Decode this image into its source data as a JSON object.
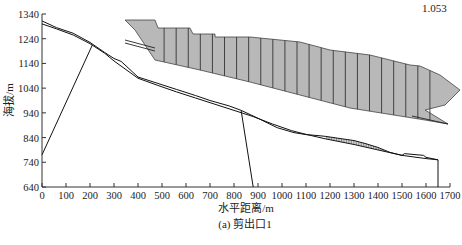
{
  "chart_data": {
    "type": "line",
    "title": "",
    "caption": "(a) 剪出口1",
    "xlabel": "水平距离/m",
    "ylabel": "海拔/m",
    "xlim": [
      0,
      1700
    ],
    "ylim": [
      640,
      1340
    ],
    "xticks": [
      0,
      100,
      200,
      300,
      400,
      500,
      600,
      700,
      800,
      900,
      1000,
      1100,
      1200,
      1300,
      1400,
      1500,
      1600,
      1700
    ],
    "yticks": [
      640,
      740,
      840,
      940,
      1040,
      1140,
      1240,
      1340
    ],
    "grid": false,
    "legend": null,
    "annotations": [
      {
        "text": "1.053",
        "meaning": "factor of safety",
        "position": "top-right"
      }
    ],
    "series": [
      {
        "name": "ground-surface-upper",
        "points": [
          [
            0,
            1312
          ],
          [
            60,
            1285
          ],
          [
            130,
            1262
          ],
          [
            200,
            1225
          ],
          [
            260,
            1185
          ],
          [
            300,
            1160
          ],
          [
            330,
            1148
          ],
          [
            400,
            1085
          ],
          [
            480,
            1060
          ],
          [
            560,
            1035
          ],
          [
            640,
            1010
          ],
          [
            700,
            990
          ],
          [
            780,
            968
          ],
          [
            830,
            950
          ],
          [
            900,
            918
          ],
          [
            980,
            880
          ],
          [
            1050,
            860
          ],
          [
            1100,
            852
          ],
          [
            1150,
            848
          ],
          [
            1180,
            845
          ]
        ]
      },
      {
        "name": "ground-surface-lower",
        "points": [
          [
            0,
            1300
          ],
          [
            60,
            1280
          ],
          [
            130,
            1255
          ],
          [
            200,
            1220
          ],
          [
            260,
            1182
          ],
          [
            300,
            1150
          ],
          [
            400,
            1080
          ],
          [
            480,
            1052
          ],
          [
            560,
            1025
          ],
          [
            640,
            1000
          ],
          [
            720,
            975
          ],
          [
            800,
            950
          ],
          [
            880,
            925
          ],
          [
            960,
            895
          ],
          [
            1040,
            868
          ],
          [
            1100,
            853
          ],
          [
            1180,
            835
          ]
        ]
      },
      {
        "name": "shear-outlet-left",
        "points": [
          [
            0,
            770
          ],
          [
            210,
            1215
          ]
        ]
      },
      {
        "name": "shear-outlet-right",
        "points": [
          [
            830,
            948
          ],
          [
            880,
            640
          ]
        ]
      },
      {
        "name": "lower-slide-mass-bottom",
        "points": [
          [
            1180,
            835
          ],
          [
            1300,
            812
          ],
          [
            1400,
            790
          ],
          [
            1500,
            768
          ],
          [
            1600,
            755
          ],
          [
            1650,
            750
          ],
          [
            1650,
            640
          ]
        ]
      },
      {
        "name": "lower-slide-mass-top",
        "points": [
          [
            1180,
            845
          ],
          [
            1250,
            835
          ],
          [
            1300,
            828
          ],
          [
            1350,
            815
          ],
          [
            1400,
            800
          ],
          [
            1450,
            780
          ],
          [
            1500,
            768
          ],
          [
            1510,
            775
          ],
          [
            1590,
            768
          ],
          [
            1600,
            760
          ],
          [
            1650,
            750
          ]
        ]
      }
    ],
    "inset": {
      "description": "enlarged view of sliding mass with vertical slices (shaded gray)",
      "top_edge_px": [
        [
          125,
          20
        ],
        [
          155,
          20
        ],
        [
          158,
          28
        ],
        [
          190,
          28
        ],
        [
          193,
          34
        ],
        [
          215,
          34
        ],
        [
          215,
          37
        ],
        [
          250,
          37
        ],
        [
          300,
          42
        ],
        [
          330,
          50
        ],
        [
          370,
          55
        ],
        [
          410,
          65
        ],
        [
          420,
          66
        ],
        [
          440,
          75
        ],
        [
          460,
          90
        ],
        [
          445,
          105
        ],
        [
          425,
          110
        ]
      ],
      "bottom_edge_px": [
        [
          125,
          20
        ],
        [
          135,
          30
        ],
        [
          145,
          45
        ],
        [
          155,
          60
        ],
        [
          200,
          70
        ],
        [
          250,
          82
        ],
        [
          300,
          95
        ],
        [
          350,
          108
        ],
        [
          400,
          116
        ],
        [
          425,
          120
        ],
        [
          448,
          124
        ]
      ],
      "slice_count": 24
    }
  },
  "labels": {
    "fs": "1.053",
    "xlabel": "水平距离/m",
    "ylabel": "海拔/m",
    "caption": "(a) 剪出口1"
  }
}
